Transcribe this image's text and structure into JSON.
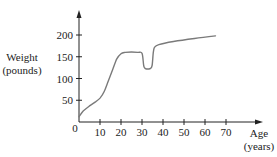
{
  "chart_data": {
    "type": "line",
    "title": "",
    "xlabel": "Age (years)",
    "xlabel_lines": [
      "Age",
      "(years)"
    ],
    "ylabel": "Weight (pounds)",
    "ylabel_lines": [
      "Weight",
      "(pounds)"
    ],
    "origin_label": "0",
    "x_ticks": [
      10,
      20,
      30,
      40,
      50,
      60,
      70
    ],
    "y_ticks": [
      50,
      100,
      150,
      200
    ],
    "xlim": [
      0,
      82
    ],
    "ylim": [
      0,
      250
    ],
    "grid": false,
    "legend": null,
    "series": [
      {
        "name": "Weight",
        "color": "#7a7a7a",
        "x": [
          0,
          2,
          5,
          8,
          10,
          12,
          14,
          16,
          18,
          20,
          22,
          25,
          28,
          30,
          30.8,
          31.5,
          34,
          34.8,
          35.4,
          36,
          38,
          45,
          55,
          65
        ],
        "y": [
          12,
          25,
          37,
          47,
          55,
          70,
          95,
          120,
          145,
          157,
          160,
          161,
          160,
          158,
          130,
          123,
          123,
          130,
          160,
          172,
          178,
          185,
          192,
          198
        ]
      }
    ]
  }
}
